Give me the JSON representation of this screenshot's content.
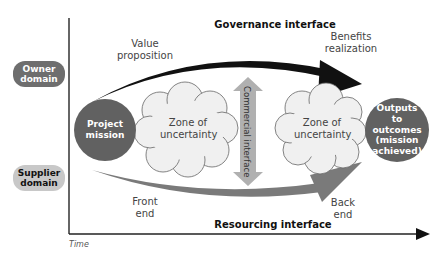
{
  "title": "Governance interface",
  "bottom_interface": "Resourcing interface",
  "vertical_interface": "Commercial interface",
  "domains": {
    "owner": "Owner domain",
    "supplier": "Supplier domain"
  },
  "nodes": {
    "start": "Project mission",
    "end": "Outputs to outcomes (mission achieved)",
    "cloud_left": "Zone of uncertainty",
    "cloud_right": "Zone of uncertainty"
  },
  "labels": {
    "value_proposition": "Value proposition",
    "benefits_realization": "Benefits realization",
    "front_end": "Front end",
    "back_end": "Back end"
  },
  "axis": {
    "x_label": "Time"
  },
  "colors": {
    "dark_circle": "#616161",
    "owner_pill": "#6e6e6e",
    "supplier_pill": "#c8c8c8",
    "top_arrow": "#111111",
    "bottom_arrow": "#7a7a7a",
    "commercial_arrow": "#b0b0b0",
    "cloud_fill": "#f0f0f0"
  }
}
